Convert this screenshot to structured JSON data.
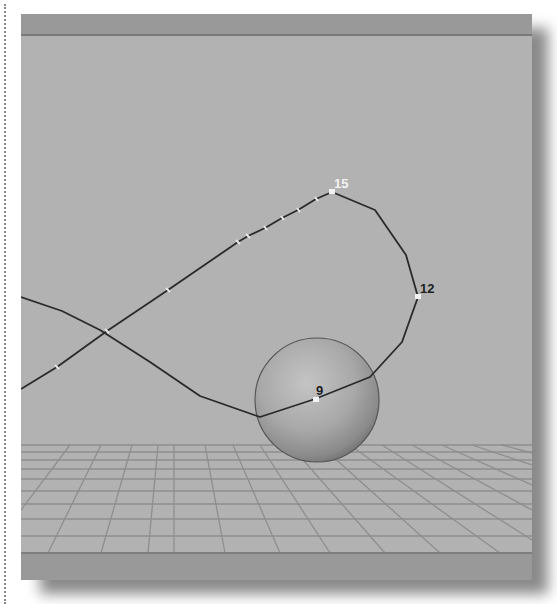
{
  "viewport": {
    "name": "3D perspective viewport",
    "background_color": "#b2b2b2",
    "bar_color": "#999999"
  },
  "scene": {
    "objects": [
      {
        "type": "sphere",
        "name": "ball",
        "center": [
          317,
          400
        ],
        "radius": 62
      },
      {
        "type": "ground-grid",
        "name": "floor-grid",
        "horizon_y": 445
      }
    ],
    "motion_path": {
      "color": "#2a2a2a",
      "frame_labels": [
        {
          "frame": "15",
          "color": "#f2f2f2"
        },
        {
          "frame": "12",
          "color": "#1e1e1e"
        },
        {
          "frame": "9",
          "color": "#1e1e1e"
        }
      ]
    }
  }
}
